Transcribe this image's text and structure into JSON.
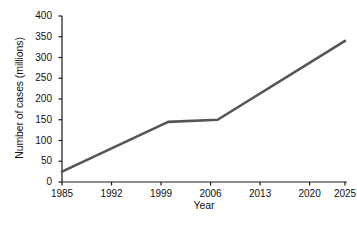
{
  "chart_data": {
    "type": "line",
    "title": "",
    "xlabel": "Year",
    "ylabel": "Number of cases (millions)",
    "xlim": [
      1985,
      2025
    ],
    "ylim": [
      0,
      400
    ],
    "grid": false,
    "legend": "none",
    "line_color": "#555555",
    "axis_color": "#1a1a1a",
    "xticks": [
      1985,
      1992,
      1999,
      2006,
      2013,
      2020,
      2025
    ],
    "xtick_labels": [
      "1985",
      "1992",
      "1999",
      "2006",
      "2013",
      "2020",
      "2025"
    ],
    "yticks": [
      0,
      50,
      100,
      150,
      200,
      250,
      300,
      350,
      400
    ],
    "ytick_labels": [
      "0",
      "50",
      "100",
      "150",
      "200",
      "250",
      "300",
      "350",
      "400"
    ],
    "series": [
      {
        "name": "Number of cases",
        "x": [
          1985,
          2000,
          2007,
          2025
        ],
        "values": [
          25,
          145,
          150,
          340
        ]
      }
    ]
  },
  "caption": {
    "text": "",
    "note": "cropped faint text fragment at bottom edge, illegible"
  }
}
